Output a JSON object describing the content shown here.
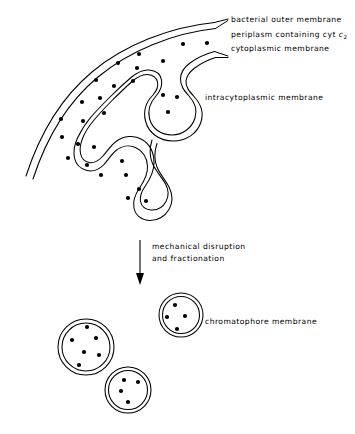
{
  "figure": {
    "background_color": "#ffffff",
    "ink_color": "#000000",
    "width": 355,
    "height": 434
  },
  "labels": {
    "outer_membrane": "bacterial outer membrane",
    "periplasm_prefix": "periplasm containing cyt ",
    "periplasm_italic": "c",
    "periplasm_subscript": "2",
    "cytoplasmic_membrane": "cytoplasmic membrane",
    "intracytoplasmic_membrane": "intracytoplasmic membrane",
    "chromatophore_membrane": "chromatophore membrane"
  },
  "process_arrow": {
    "caption_line_1": "mechanical disruption",
    "caption_line_2": "and fractionation",
    "direction": "down"
  },
  "cell": {
    "periplasm_dots": [
      {
        "x": 183,
        "y": 44
      },
      {
        "x": 207,
        "y": 43
      },
      {
        "x": 139,
        "y": 54
      },
      {
        "x": 163,
        "y": 61
      },
      {
        "x": 137,
        "y": 68
      },
      {
        "x": 118,
        "y": 63
      },
      {
        "x": 133,
        "y": 81
      },
      {
        "x": 114,
        "y": 86
      },
      {
        "x": 96,
        "y": 80
      },
      {
        "x": 100,
        "y": 98
      },
      {
        "x": 82,
        "y": 102
      },
      {
        "x": 104,
        "y": 113
      },
      {
        "x": 83,
        "y": 121
      },
      {
        "x": 61,
        "y": 119
      },
      {
        "x": 62,
        "y": 137
      },
      {
        "x": 78,
        "y": 144
      },
      {
        "x": 94,
        "y": 147
      },
      {
        "x": 87,
        "y": 165
      },
      {
        "x": 101,
        "y": 175
      },
      {
        "x": 68,
        "y": 158
      }
    ],
    "invagination_dots": [
      {
        "x": 163,
        "y": 95
      },
      {
        "x": 177,
        "y": 97
      },
      {
        "x": 168,
        "y": 112
      },
      {
        "x": 122,
        "y": 161
      },
      {
        "x": 126,
        "y": 175
      },
      {
        "x": 139,
        "y": 189
      },
      {
        "x": 128,
        "y": 198
      },
      {
        "x": 146,
        "y": 201
      }
    ]
  },
  "chromatophores": [
    {
      "name": "large-vesicle",
      "cx": 86,
      "cy": 347,
      "outer_r": 28,
      "inner_r": 24,
      "dots": [
        {
          "x": 87,
          "y": 327
        },
        {
          "x": 72,
          "y": 340
        },
        {
          "x": 96,
          "y": 338
        },
        {
          "x": 84,
          "y": 352
        },
        {
          "x": 99,
          "y": 355
        },
        {
          "x": 79,
          "y": 365
        }
      ]
    },
    {
      "name": "top-right-vesicle",
      "cx": 181,
      "cy": 315,
      "outer_r": 22,
      "inner_r": 18.5,
      "dots": [
        {
          "x": 175,
          "y": 305
        },
        {
          "x": 167,
          "y": 317
        },
        {
          "x": 185,
          "y": 316
        },
        {
          "x": 177,
          "y": 329
        }
      ]
    },
    {
      "name": "bottom-vesicle",
      "cx": 128,
      "cy": 390,
      "outer_r": 23,
      "inner_r": 19.5,
      "dots": [
        {
          "x": 124,
          "y": 380
        },
        {
          "x": 138,
          "y": 382
        },
        {
          "x": 121,
          "y": 391
        },
        {
          "x": 128,
          "y": 402
        }
      ]
    }
  ]
}
